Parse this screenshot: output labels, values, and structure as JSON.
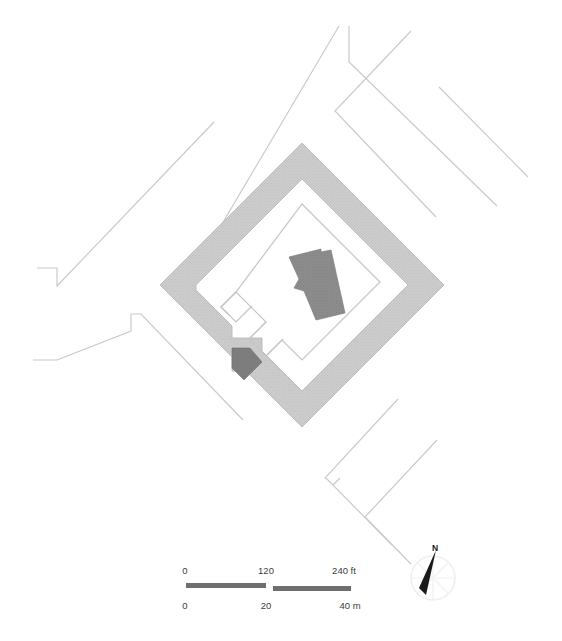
{
  "figure": {
    "kind": "site-plan",
    "orientation_note": "plan rotated approximately 45 degrees",
    "background_color": "#ffffff"
  },
  "colors": {
    "enclosure_wall": "#c9c9c9",
    "enclosure_wall_stroke": "#b4b4b4",
    "building": "#8a8a8a",
    "gate_block": "#7d7d7d",
    "inner_enclosure_outline": "#c4c4c4",
    "road_line": "#c9c9c9",
    "scalebar_fill": "#6f6f6f",
    "text": "#3c3c3c",
    "north_arrow": "#1a1a1a",
    "compass_rose": "#eeeeee"
  },
  "site": {
    "outer_enclosure": {
      "name": "outer enclosure wall",
      "shape": "diamond",
      "fill": "#c9c9c9"
    },
    "inner_enclosure": {
      "name": "inner enclosure outline",
      "shape": "notched diamond",
      "stroke": "#c4c4c4"
    },
    "main_building": {
      "name": "L-shaped structure",
      "fill": "#8a8a8a"
    },
    "gate_block": {
      "name": "gate block",
      "fill": "#7d7d7d"
    },
    "roads": [
      {
        "id": "road-north",
        "label": "road north"
      },
      {
        "id": "road-northeast",
        "label": "road northeast"
      },
      {
        "id": "road-west",
        "label": "road west"
      },
      {
        "id": "road-southeast",
        "label": "road southeast"
      },
      {
        "id": "road-south",
        "label": "road south"
      }
    ]
  },
  "scalebar": {
    "feet": {
      "unit": "ft",
      "ticks": [
        "0",
        "120",
        "240 ft"
      ],
      "values": [
        0,
        120,
        240
      ]
    },
    "meters": {
      "unit": "m",
      "ticks": [
        "0",
        "20",
        "40 m"
      ],
      "values": [
        0,
        20,
        40
      ]
    }
  },
  "north_arrow": {
    "label": "N",
    "icon": "north-arrow-icon"
  }
}
